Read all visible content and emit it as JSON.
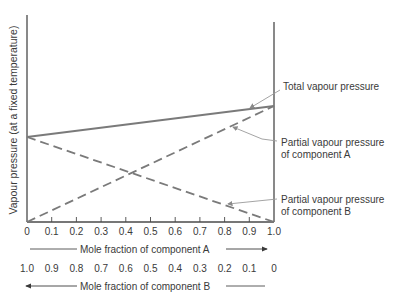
{
  "chart_data": {
    "type": "line",
    "title": "",
    "ylabel": "Vapour pressure (at a fixed temperature)",
    "xlabel_top": "Mole fraction of component A",
    "xlabel_bottom": "Mole fraction of component B",
    "x_ticks_A": [
      "0",
      "0.1",
      "0.2",
      "0.3",
      "0.4",
      "0.5",
      "0.6",
      "0.7",
      "0.8",
      "0.9",
      "1.0"
    ],
    "x_ticks_B": [
      "1.0",
      "0.9",
      "0.8",
      "0.7",
      "0.6",
      "0.5",
      "0.4",
      "0.3",
      "0.2",
      "0.1",
      "0"
    ],
    "xlim": [
      0,
      1
    ],
    "ylim": [
      0,
      1.78
    ],
    "grid": false,
    "y_ticks": [],
    "series": [
      {
        "name": "Total vapour pressure",
        "style": "solid",
        "x": [
          0,
          1
        ],
        "y": [
          0.73,
          1.0
        ]
      },
      {
        "name": "Partial vapour pressure of component A",
        "style": "dashed",
        "x": [
          0,
          1
        ],
        "y": [
          0,
          1.0
        ]
      },
      {
        "name": "Partial vapour pressure of component B",
        "style": "dashed",
        "x": [
          0,
          1
        ],
        "y": [
          0.73,
          0
        ]
      }
    ],
    "annotations": [
      "Total vapour pressure",
      "Partial vapour pressure of component A",
      "Partial vapour pressure of component B"
    ]
  },
  "labels": {
    "ylabel": "Vapour pressure (at a fixed temperature)",
    "total": "Total vapour pressure",
    "partialA_1": "Partial vapour pressure",
    "partialA_2": "of component A",
    "partialB_1": "Partial vapour pressure",
    "partialB_2": "of component B",
    "axisA": "Mole fraction of component A",
    "axisB": "Mole fraction of component B"
  },
  "colors": {
    "axis": "#4a4a4a",
    "line": "#7a7a7a",
    "leader": "#9a9a9a",
    "text": "#3a3a3a"
  }
}
